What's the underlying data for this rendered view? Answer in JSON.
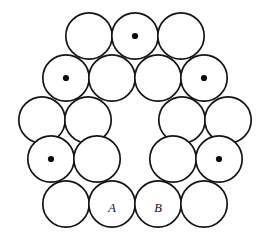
{
  "figure": {
    "canvas": {
      "width": 270,
      "height": 249
    },
    "style": {
      "background_color": "#ffffff",
      "stroke_color": "#151515",
      "stroke_width": 1.7,
      "fill_color": "#ffffff",
      "dot_color": "#0c0c0c",
      "dot_radius": 3.1,
      "label_color": "#111111",
      "label_font_size": 12.5
    },
    "circle_radius": 23.2,
    "total_circles": 18,
    "marked_circles": 6,
    "labelled_circles": 2,
    "circles": [
      {
        "id": "c01",
        "name": "top-left-circle",
        "cx": 89,
        "cy": 36,
        "marked": false,
        "label": ""
      },
      {
        "id": "c02",
        "name": "top-center-circle",
        "cx": 135,
        "cy": 36,
        "marked": true,
        "label": ""
      },
      {
        "id": "c03",
        "name": "top-right-circle",
        "cx": 181,
        "cy": 36,
        "marked": false,
        "label": ""
      },
      {
        "id": "c04",
        "name": "upper-left-circle",
        "cx": 66,
        "cy": 78,
        "marked": true,
        "label": ""
      },
      {
        "id": "c05",
        "name": "upper-inner-left-circle",
        "cx": 112,
        "cy": 78,
        "marked": false,
        "label": ""
      },
      {
        "id": "c06",
        "name": "upper-inner-right-circle",
        "cx": 158,
        "cy": 78,
        "marked": false,
        "label": ""
      },
      {
        "id": "c07",
        "name": "upper-right-circle",
        "cx": 204,
        "cy": 78,
        "marked": true,
        "label": ""
      },
      {
        "id": "c08",
        "name": "left-outer-upper-circle",
        "cx": 42,
        "cy": 120,
        "marked": false,
        "label": ""
      },
      {
        "id": "c09",
        "name": "left-inner-upper-circle",
        "cx": 88,
        "cy": 120,
        "marked": false,
        "label": ""
      },
      {
        "id": "c10",
        "name": "right-inner-upper-circle",
        "cx": 182,
        "cy": 120,
        "marked": false,
        "label": ""
      },
      {
        "id": "c11",
        "name": "right-outer-upper-circle",
        "cx": 228,
        "cy": 120,
        "marked": false,
        "label": ""
      },
      {
        "id": "c12",
        "name": "left-marked-circle",
        "cx": 51,
        "cy": 159,
        "marked": true,
        "label": ""
      },
      {
        "id": "c13",
        "name": "left-inner-lower-circle",
        "cx": 97,
        "cy": 159,
        "marked": false,
        "label": ""
      },
      {
        "id": "c14",
        "name": "right-inner-lower-circle",
        "cx": 173,
        "cy": 159,
        "marked": false,
        "label": ""
      },
      {
        "id": "c15",
        "name": "right-marked-circle",
        "cx": 219,
        "cy": 159,
        "marked": true,
        "label": ""
      },
      {
        "id": "c16",
        "name": "bottom-left-circle",
        "cx": 66,
        "cy": 204,
        "marked": false,
        "label": ""
      },
      {
        "id": "c17",
        "name": "bottom-circle-a",
        "cx": 112,
        "cy": 204,
        "marked": false,
        "label": "A"
      },
      {
        "id": "c18",
        "name": "bottom-circle-b",
        "cx": 158,
        "cy": 204,
        "marked": false,
        "label": "B"
      },
      {
        "id": "c19",
        "name": "bottom-right-circle",
        "cx": 204,
        "cy": 204,
        "marked": false,
        "label": ""
      }
    ]
  }
}
